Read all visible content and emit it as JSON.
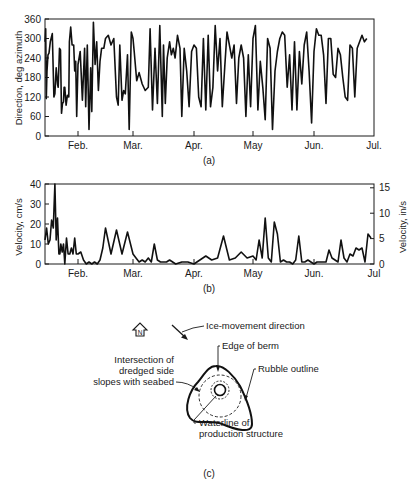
{
  "figure": {
    "panels": [
      {
        "id": "a",
        "caption": "(a)"
      },
      {
        "id": "b",
        "caption": "(b)"
      },
      {
        "id": "c",
        "caption": "(c)"
      }
    ]
  },
  "chart_data": [
    {
      "panel": "a",
      "type": "line",
      "title": "",
      "xlabel": "",
      "ylabel": "Direction, deg azimuth",
      "ylim": [
        0,
        360
      ],
      "yticks": [
        0,
        60,
        120,
        180,
        240,
        300,
        360
      ],
      "xtick_labels": [
        "Feb.",
        "Mar.",
        "Apr.",
        "May",
        "Jun.",
        "Jul."
      ],
      "grid": false,
      "series": [
        {
          "name": "Ice-movement direction",
          "x": [
            0,
            0.02,
            0.04,
            0.06,
            0.09,
            0.12,
            0.16,
            0.22,
            0.27,
            0.3,
            0.34,
            0.38,
            0.4,
            0.44,
            0.47,
            0.5,
            0.53,
            0.56,
            0.58,
            0.6,
            0.64,
            0.68,
            0.72,
            0.74,
            0.78,
            0.82,
            0.87,
            0.9,
            0.93,
            0.96,
            1.0,
            1.04,
            1.08,
            1.12,
            1.14,
            1.17,
            1.2,
            1.23,
            1.25,
            1.28,
            1.31,
            1.34,
            1.37,
            1.4,
            1.43,
            1.47,
            1.5,
            1.55,
            1.6,
            1.65,
            1.7,
            1.73,
            1.76,
            1.8,
            1.83,
            1.86,
            1.9,
            1.93,
            1.97,
            2.0,
            2.02,
            2.06,
            2.1,
            2.15,
            2.2,
            2.25,
            2.28,
            2.32,
            2.36,
            2.4,
            2.44,
            2.48,
            2.5,
            2.53,
            2.56,
            2.6,
            2.63,
            2.66,
            2.69,
            2.73,
            2.77,
            2.8,
            2.84,
            2.88,
            2.92,
            2.96,
            3.0,
            3.04,
            3.08,
            3.12,
            3.16,
            3.2,
            3.24,
            3.28,
            3.32,
            3.36,
            3.4,
            3.44,
            3.48,
            3.52,
            3.56,
            3.6,
            3.64,
            3.68,
            3.72,
            3.76,
            3.8,
            3.84,
            3.88,
            3.92,
            3.96,
            4.0,
            4.04,
            4.08,
            4.12,
            4.16,
            4.2,
            4.24,
            4.28,
            4.32,
            4.36,
            4.4,
            4.44,
            4.48,
            4.52,
            4.56,
            4.6,
            4.64,
            4.68,
            4.72,
            4.76,
            4.8,
            4.84,
            4.88,
            4.92,
            4.96,
            5.0,
            5.04,
            5.08,
            5.12,
            5.16,
            5.2,
            5.24,
            5.28,
            5.32,
            5.36,
            5.4,
            5.44,
            5.48,
            5.52,
            5.56,
            5.6,
            5.64,
            5.68,
            5.72,
            5.76,
            5.8,
            5.84,
            5.88,
            5.92,
            5.96
          ],
          "values": [
            290,
            330,
            115,
            200,
            250,
            255,
            290,
            315,
            120,
            130,
            210,
            160,
            150,
            270,
            265,
            70,
            100,
            105,
            150,
            150,
            95,
            125,
            120,
            290,
            335,
            280,
            280,
            200,
            230,
            60,
            220,
            260,
            110,
            270,
            90,
            280,
            20,
            210,
            75,
            350,
            220,
            290,
            140,
            230,
            270,
            270,
            300,
            310,
            280,
            300,
            120,
            95,
            280,
            110,
            140,
            130,
            250,
            20,
            320,
            300,
            260,
            170,
            195,
            160,
            140,
            150,
            330,
            80,
            270,
            100,
            340,
            60,
            280,
            100,
            240,
            290,
            250,
            270,
            240,
            310,
            270,
            60,
            270,
            200,
            90,
            260,
            280,
            270,
            120,
            90,
            300,
            80,
            310,
            90,
            150,
            340,
            200,
            300,
            90,
            210,
            320,
            280,
            240,
            280,
            100,
            240,
            280,
            240,
            60,
            250,
            90,
            300,
            340,
            80,
            230,
            150,
            50,
            300,
            270,
            20,
            200,
            260,
            300,
            320,
            310,
            150,
            250,
            80,
            290,
            80,
            260,
            160,
            280,
            320,
            200,
            40,
            260,
            330,
            310,
            310,
            250,
            100,
            300,
            300,
            190,
            180,
            270,
            250,
            180,
            120,
            110,
            280,
            270,
            120,
            270,
            290,
            310,
            290,
            300
          ]
        }
      ]
    },
    {
      "panel": "b",
      "type": "line",
      "title": "",
      "xlabel": "",
      "ylabel": "Velocity, cm/s",
      "ylabel_right": "Velocity, in/s",
      "ylim": [
        0,
        40
      ],
      "yticks": [
        0,
        10,
        20,
        30,
        40
      ],
      "yticks_right": [
        0,
        5,
        10,
        15
      ],
      "xtick_labels": [
        "Feb.",
        "Mar.",
        "Apr.",
        "May",
        "Jun.",
        "Jul"
      ],
      "grid": false,
      "series": [
        {
          "name": "Ice-movement velocity",
          "x": [
            0,
            0.05,
            0.1,
            0.15,
            0.2,
            0.25,
            0.3,
            0.34,
            0.38,
            0.42,
            0.45,
            0.48,
            0.52,
            0.56,
            0.6,
            0.65,
            0.7,
            0.75,
            0.8,
            0.85,
            0.9,
            0.95,
            1.0,
            1.05,
            1.1,
            1.15,
            1.2,
            1.25,
            1.3,
            1.35,
            1.4,
            1.45,
            1.5,
            1.6,
            1.7,
            1.8,
            1.9,
            2.0,
            2.05,
            2.1,
            2.15,
            2.2,
            2.25,
            2.3,
            2.35,
            2.4,
            2.45,
            2.5,
            2.55,
            2.6,
            2.7,
            2.8,
            2.9,
            3.0,
            3.05,
            3.1,
            3.2,
            3.3,
            3.4,
            3.5,
            3.6,
            3.7,
            3.8,
            3.9,
            4.0,
            4.05,
            4.1,
            4.15,
            4.2,
            4.25,
            4.3,
            4.35,
            4.4,
            4.45,
            4.5,
            4.55,
            4.6,
            4.65,
            4.7,
            4.75,
            4.8,
            4.85,
            4.9,
            4.95,
            5.0,
            5.05,
            5.1,
            5.15,
            5.2,
            5.25,
            5.3,
            5.35,
            5.4,
            5.45,
            5.5,
            5.55,
            5.6,
            5.65,
            5.7,
            5.75,
            5.8,
            5.85,
            5.9,
            5.95
          ],
          "values": [
            12,
            18,
            10,
            12,
            22,
            18,
            40,
            12,
            23,
            5,
            5,
            10,
            6,
            10,
            0,
            13,
            5,
            5,
            8,
            5,
            13,
            5,
            5,
            6,
            2,
            0,
            1,
            0,
            1,
            0,
            2,
            8,
            18,
            5,
            17,
            5,
            16,
            5,
            3,
            1,
            2,
            1,
            3,
            1,
            10,
            2,
            1,
            1,
            1,
            2,
            0,
            1,
            1,
            0,
            1,
            2,
            4,
            2,
            3,
            14,
            2,
            3,
            6,
            3,
            4,
            2,
            12,
            3,
            23,
            3,
            1,
            21,
            15,
            1,
            2,
            1,
            1,
            0,
            2,
            14,
            1,
            1,
            2,
            1,
            0,
            1,
            1,
            1,
            1,
            7,
            3,
            2,
            1,
            12,
            3,
            1,
            5,
            4,
            8,
            7,
            8,
            1,
            15,
            13,
            5,
            11,
            3
          ]
        }
      ]
    }
  ],
  "diagram": {
    "compass": {
      "label": "N",
      "icon": "north-arrow-icon"
    },
    "labels": {
      "ice_direction": "Ice-movement direction",
      "edge_of_berm": "Edge of berm",
      "intersection_line1": "Intersection of",
      "intersection_line2": "dredged side",
      "intersection_line3": "slopes with seabed",
      "rubble_outline": "Rubble outline",
      "waterline_line1": "Waterline of",
      "waterline_line2": "production structure"
    }
  }
}
